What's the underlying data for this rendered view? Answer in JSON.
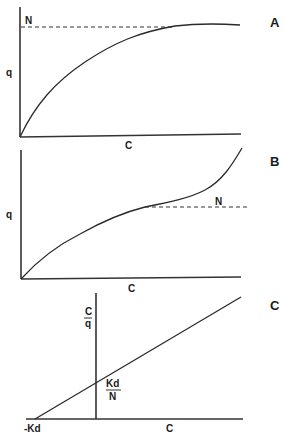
{
  "panels": [
    {
      "id": "A",
      "panel_label": "A",
      "y_axis_label": "q",
      "x_axis_label": "C",
      "asymptote_label": "N",
      "curve_type": "saturating (Langmuir)"
    },
    {
      "id": "B",
      "panel_label": "B",
      "y_axis_label": "q",
      "x_axis_label": "C",
      "asymptote_label": "N",
      "curve_type": "sigmoidal with rise beyond plateau (BET-like)"
    },
    {
      "id": "C",
      "panel_label": "C",
      "y_axis_label_numerator": "C",
      "y_axis_label_denominator": "q",
      "x_axis_label": "C",
      "intercept_label_numerator": "Kd",
      "intercept_label_denominator": "N",
      "x_intercept_label": "-Kd",
      "curve_type": "linear (linearized Langmuir)"
    }
  ],
  "colors": {
    "line": "#2a2a2a",
    "background": "#ffffff"
  }
}
